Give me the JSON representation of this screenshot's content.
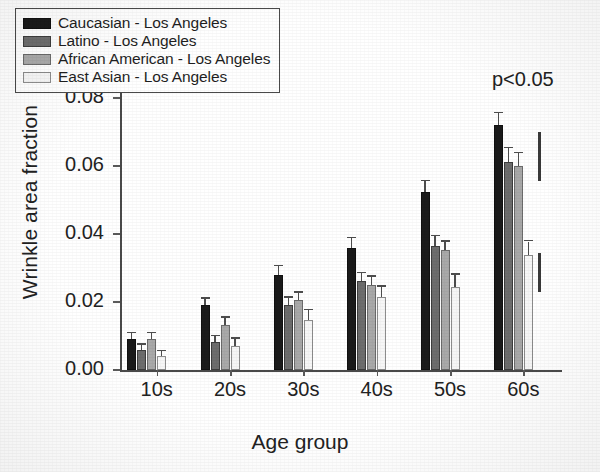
{
  "chart_data": {
    "type": "bar",
    "title": "",
    "xlabel": "Age group",
    "ylabel": "Wrinkle area fraction",
    "categories": [
      "10s",
      "20s",
      "30s",
      "40s",
      "50s",
      "60s"
    ],
    "ylim": [
      0.0,
      0.1
    ],
    "yticks": [
      0.0,
      0.02,
      0.04,
      0.06,
      0.08,
      0.1
    ],
    "ytick_labels": [
      "0.00",
      "0.02",
      "0.04",
      "0.06",
      "0.08",
      "0.10"
    ],
    "grid": false,
    "legend_position": "top-left",
    "series": [
      {
        "name": "Caucasian - Los Angeles",
        "color": "#1b1b1b",
        "values": [
          0.009,
          0.019,
          0.028,
          0.036,
          0.0525,
          0.072
        ],
        "errors": [
          0.0018,
          0.002,
          0.0025,
          0.0028,
          0.003,
          0.0035
        ]
      },
      {
        "name": "Latino - Los Angeles",
        "color": "#6d6d6d",
        "values": [
          0.006,
          0.0082,
          0.0192,
          0.0262,
          0.0365,
          0.0612
        ],
        "errors": [
          0.0015,
          0.0018,
          0.002,
          0.0022,
          0.0028,
          0.004
        ]
      },
      {
        "name": "African American - Los Angeles",
        "color": "#a9a9a9",
        "values": [
          0.009,
          0.0132,
          0.0205,
          0.025,
          0.0352,
          0.06
        ],
        "errors": [
          0.0018,
          0.0022,
          0.0022,
          0.0025,
          0.0025,
          0.0038
        ]
      },
      {
        "name": "East Asian - Los Angeles",
        "color": "#f6f6f6",
        "values": [
          0.004,
          0.0072,
          0.0148,
          0.0215,
          0.0245,
          0.0338
        ],
        "errors": [
          0.0015,
          0.002,
          0.0028,
          0.003,
          0.0035,
          0.004
        ]
      }
    ],
    "annotations": [
      {
        "name": "p-value",
        "text": "p<0.05"
      },
      {
        "name": "significance-bar-upper",
        "y_from": 0.07,
        "y_to": 0.0555
      },
      {
        "name": "significance-bar-lower",
        "y_from": 0.0345,
        "y_to": 0.023
      }
    ]
  }
}
